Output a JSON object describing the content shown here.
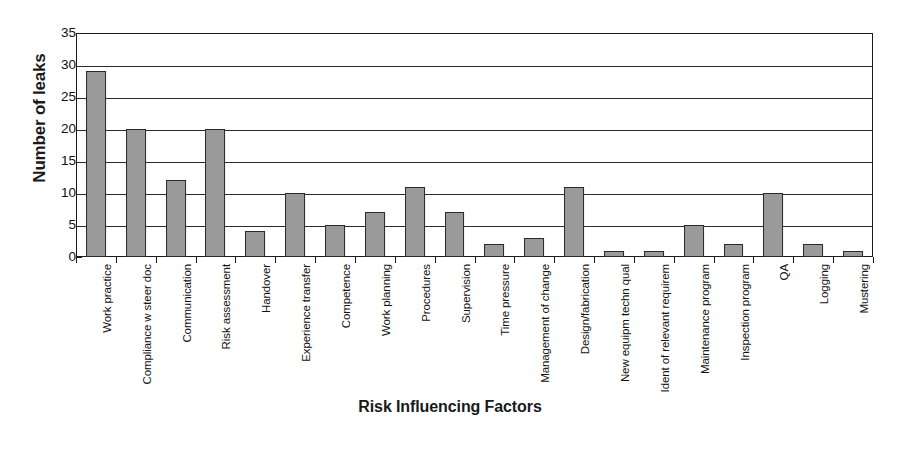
{
  "chart_data": {
    "type": "bar",
    "title": "",
    "xlabel": "Risk Influencing Factors",
    "ylabel": "Number of leaks",
    "ylim": [
      0,
      35
    ],
    "ytick_step": 5,
    "yticks": [
      35,
      30,
      25,
      20,
      15,
      10,
      5,
      0
    ],
    "grid": "horizontal",
    "legend": "none",
    "bar_color": "#9a9a9a",
    "bar_border_color": "#2a2a2a",
    "axis_color": "#1a1a1a",
    "categories": [
      "Work practice",
      "Compliance w steer doc",
      "Communication",
      "Risk assessment",
      "Handover",
      "Experience transfer",
      "Competence",
      "Work planning",
      "Procedures",
      "Supervision",
      "Time pressure",
      "Management of change",
      "Design/fabrication",
      "New equipm techn qual",
      "Ident of relevant requirem",
      "Maintenance program",
      "Inspection program",
      "QA",
      "Logging",
      "Mustering"
    ],
    "values": [
      29,
      20,
      12,
      20,
      4,
      10,
      5,
      7,
      11,
      7,
      2,
      3,
      11,
      1,
      1,
      5,
      2,
      10,
      2,
      1
    ]
  }
}
